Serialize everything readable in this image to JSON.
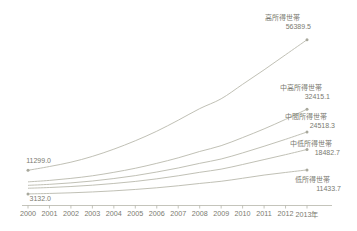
{
  "chart_data": {
    "type": "line",
    "title": "",
    "subtitle": "",
    "xlabel": "",
    "ylabel": "",
    "grid": false,
    "legend_position": "inline-right-end-labels",
    "x": [
      2000,
      2001,
      2002,
      2003,
      2004,
      2005,
      2006,
      2007,
      2008,
      2009,
      2010,
      2011,
      2012,
      2013
    ],
    "xtick_labels": [
      "2000",
      "2001",
      "2002",
      "2003",
      "2004",
      "2005",
      "2006",
      "2007",
      "2008",
      "2009",
      "2010",
      "2011",
      "2012",
      "2013年"
    ],
    "xlim": [
      2000,
      2013
    ],
    "ylim": [
      0,
      60000
    ],
    "series": [
      {
        "name": "高所得世帯",
        "end_value": "56389.5",
        "start_value": "11299.0",
        "values": [
          11299.0,
          12600.0,
          14100.0,
          16100.0,
          18600.0,
          21500.0,
          24800.0,
          28600.0,
          32600.0,
          36000.0,
          41000.0,
          46000.0,
          51200.0,
          56389.5
        ]
      },
      {
        "name": "中高所得世帯",
        "end_value": "32415.1",
        "values": [
          7300.0,
          7800.0,
          8500.0,
          9400.0,
          10600.0,
          12000.0,
          13700.0,
          15600.0,
          17800.0,
          19800.0,
          22600.0,
          25600.0,
          28900.0,
          32415.1
        ]
      },
      {
        "name": "中間所得世帯",
        "end_value": "24518.3",
        "values": [
          6100.0,
          6450.0,
          6950.0,
          7600.0,
          8450.0,
          9450.0,
          10700.0,
          12100.0,
          13700.0,
          15200.0,
          17300.0,
          19600.0,
          22000.0,
          24518.3
        ]
      },
      {
        "name": "中低所得世帯",
        "end_value": "18482.7",
        "values": [
          5100.0,
          5350.0,
          5700.0,
          6150.0,
          6750.0,
          7450.0,
          8350.0,
          9400.0,
          10600.0,
          11700.0,
          13300.0,
          15000.0,
          16700.0,
          18482.7
        ]
      },
      {
        "name": "低所得世帯",
        "end_value": "11433.7",
        "start_value": "3132.0",
        "values": [
          3132.0,
          3300.0,
          3520.0,
          3820.0,
          4200.0,
          4680.0,
          5250.0,
          5950.0,
          6750.0,
          7500.0,
          8550.0,
          9650.0,
          10550.0,
          11433.7
        ]
      }
    ],
    "annotations": {
      "start_top": "11299.0",
      "start_bottom": "3132.0"
    },
    "colors": {
      "line": "#b9b9ad",
      "text": "#7a7a70",
      "axis": "#b5b5aa",
      "background": "#ffffff"
    }
  }
}
